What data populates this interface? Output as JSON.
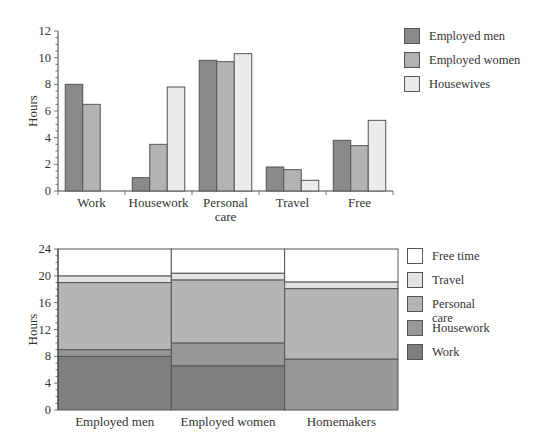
{
  "chart_data": [
    {
      "type": "bar",
      "title": "",
      "xlabel": "",
      "ylabel": "Hours",
      "ylim": [
        0,
        12
      ],
      "yticks": [
        0,
        2,
        4,
        6,
        8,
        10,
        12
      ],
      "grid": false,
      "legend_position": "right",
      "categories": [
        "Work",
        "Housework",
        "Personal care",
        "Travel",
        "Free"
      ],
      "category_labels": [
        [
          "Work"
        ],
        [
          "Housework"
        ],
        [
          "Personal",
          "care"
        ],
        [
          "Travel"
        ],
        [
          "Free"
        ]
      ],
      "series": [
        {
          "name": "Employed men",
          "color": "#8a8a8a",
          "values": [
            8.0,
            1.0,
            9.8,
            1.8,
            3.8
          ]
        },
        {
          "name": "Employed women",
          "color": "#b3b3b3",
          "values": [
            6.5,
            3.5,
            9.7,
            1.6,
            3.4
          ]
        },
        {
          "name": "Housewives",
          "color": "#ebebeb",
          "values": [
            0,
            7.8,
            10.3,
            0.8,
            5.3
          ]
        }
      ]
    },
    {
      "type": "bar",
      "stacked": true,
      "title": "",
      "xlabel": "",
      "ylabel": "Hours",
      "ylim": [
        0,
        24
      ],
      "yticks": [
        0,
        4,
        8,
        12,
        16,
        20,
        24
      ],
      "grid": false,
      "legend_position": "right",
      "categories": [
        "Employed men",
        "Employed women",
        "Homemakers"
      ],
      "series": [
        {
          "name": "Work",
          "color": "#7f7f7f",
          "values": [
            8.0,
            6.6,
            0
          ]
        },
        {
          "name": "Housework",
          "color": "#989898",
          "values": [
            1.0,
            3.4,
            7.6
          ]
        },
        {
          "name": "Personal care",
          "color": "#b5b5b5",
          "legend_lines": [
            "Personal",
            "care"
          ],
          "values": [
            10.0,
            9.4,
            10.5
          ]
        },
        {
          "name": "Travel",
          "color": "#e3e3e3",
          "values": [
            1.0,
            1.0,
            1.0
          ]
        },
        {
          "name": "Free time",
          "color": "#ffffff",
          "values": [
            4.0,
            3.6,
            4.9
          ]
        }
      ]
    }
  ]
}
